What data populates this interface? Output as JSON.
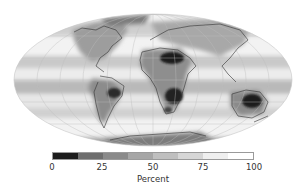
{
  "figure": {
    "type": "global map, Mollweide projection"
  },
  "colorbar": {
    "label": "Percent",
    "min": 0,
    "max": 100,
    "ticks": [
      "0",
      "25",
      "50",
      "75",
      "100"
    ],
    "segments": [
      "#1c1c1c",
      "#6e6e6e",
      "#8a8a8a",
      "#a6a6a6",
      "#bfbfbf",
      "#d6d6d6",
      "#efefef",
      "#ffffff"
    ]
  },
  "regions": [
    {
      "name": "Sahara",
      "shade": "#1e1e1e"
    },
    {
      "name": "Southern Africa",
      "shade": "#202020"
    },
    {
      "name": "Central South America",
      "shade": "#2a2a2a"
    },
    {
      "name": "Interior Australia",
      "shade": "#1e1e1e"
    }
  ]
}
